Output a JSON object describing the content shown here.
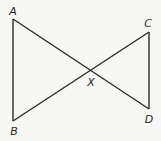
{
  "diagram": {
    "type": "geometry",
    "stroke_color": "#2a2a2a",
    "background_color": "#f7f7f5",
    "points": {
      "A": {
        "x": 13,
        "y": 19,
        "label": "A",
        "label_x": 13,
        "label_y": 11
      },
      "B": {
        "x": 13,
        "y": 121,
        "label": "B",
        "label_x": 14,
        "label_y": 131
      },
      "C": {
        "x": 149,
        "y": 32,
        "label": "C",
        "label_x": 148,
        "label_y": 23
      },
      "D": {
        "x": 149,
        "y": 109,
        "label": "D",
        "label_x": 149,
        "label_y": 119
      },
      "X": {
        "x": 91,
        "y": 70,
        "label": "X",
        "label_x": 91,
        "label_y": 82
      }
    },
    "segments": [
      {
        "from": "A",
        "to": "B"
      },
      {
        "from": "A",
        "to": "D"
      },
      {
        "from": "B",
        "to": "C"
      },
      {
        "from": "C",
        "to": "D"
      }
    ]
  }
}
